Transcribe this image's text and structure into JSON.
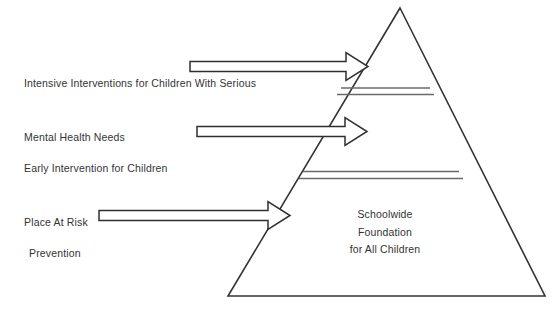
{
  "diagram": {
    "title_visible": false,
    "background_color": "#ffffff",
    "stroke_color": "#333333",
    "divider_color": "#666666",
    "arrow_fill": "#ffffff",
    "pyramid": {
      "name": "three-tier-intervention-pyramid",
      "apex": {
        "x": 400,
        "y": 8
      },
      "base_left": {
        "x": 228,
        "y": 296
      },
      "base_right": {
        "x": 545,
        "y": 296
      },
      "dividers": [
        {
          "y": 88,
          "x_start": 341,
          "x_end": 430
        },
        {
          "y": 94,
          "x_start": 338,
          "x_end": 433
        },
        {
          "y": 172,
          "x_start": 301,
          "x_end": 459
        },
        {
          "y": 178,
          "x_start": 298,
          "x_end": 462
        }
      ]
    },
    "tiers": [
      {
        "id": "tier-intensive",
        "label_lines": [
          "Intensive Interventions for Children With Serious",
          "Mental Health Needs"
        ],
        "arrow": {
          "y": 66,
          "x_start": 190,
          "x_tip": 368
        }
      },
      {
        "id": "tier-early-intervention",
        "label_lines": [
          "Early Intervention for Children",
          "Place At Risk"
        ],
        "arrow": {
          "y": 131,
          "x_start": 197,
          "x_tip": 367
        }
      },
      {
        "id": "tier-prevention",
        "label_lines": [
          "Prevention"
        ],
        "arrow": {
          "y": 215,
          "x_start": 99,
          "x_tip": 290
        },
        "inside_lines": [
          "Schoolwide",
          "Foundation",
          "for All Children"
        ]
      }
    ]
  }
}
